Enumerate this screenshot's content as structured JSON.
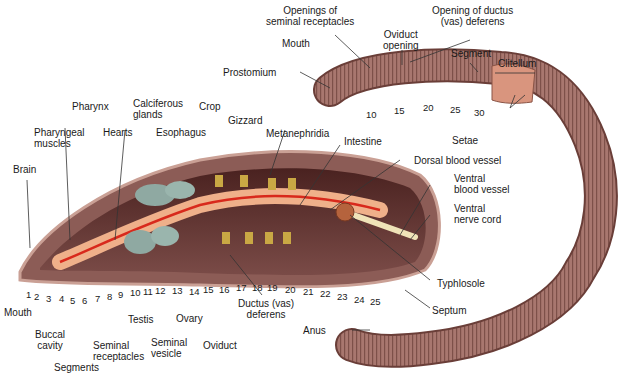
{
  "diagram": {
    "external_labels": {
      "openings_seminal": [
        "Openings of",
        "seminal receptacles"
      ],
      "opening_ductus": [
        "Opening of ductus",
        "(vas) deferens"
      ],
      "mouth_top": "Mouth",
      "oviduct_opening": [
        "Oviduct",
        "opening"
      ],
      "segment": "Segment",
      "clitellum": "Clitellum",
      "prostomium": "Prostomium",
      "setae": "Setae",
      "anus": "Anus",
      "ext_segment_numbers": [
        "10",
        "15",
        "20",
        "25",
        "30"
      ]
    },
    "internal_labels": {
      "pharynx": "Pharynx",
      "calciferous": [
        "Calciferous",
        "glands"
      ],
      "crop": "Crop",
      "pharyngeal": [
        "Pharyngeal",
        "muscles"
      ],
      "hearts": "Hearts",
      "esophagus": "Esophagus",
      "gizzard": "Gizzard",
      "metanephridia": "Metanephridia",
      "intestine": "Intestine",
      "dorsal_vessel": "Dorsal blood vessel",
      "ventral_vessel": [
        "Ventral",
        "blood vessel"
      ],
      "ventral_nerve": [
        "Ventral",
        "nerve cord"
      ],
      "brain": "Brain",
      "typhlosole": "Typhlosole",
      "septum": "Septum",
      "mouth_bottom": "Mouth",
      "buccal": [
        "Buccal",
        "cavity"
      ],
      "segments": "Segments",
      "seminal_receptacles": [
        "Seminal",
        "receptacles"
      ],
      "testis": "Testis",
      "seminal_vesicle": [
        "Seminal",
        "vesicle"
      ],
      "ovary": "Ovary",
      "oviduct": "Oviduct",
      "ductus": [
        "Ductus (vas)",
        "deferens"
      ],
      "segment_numbers": [
        "1",
        "2",
        "3",
        "4",
        "5",
        "6",
        "7",
        "8",
        "9",
        "10",
        "11",
        "12",
        "13",
        "14",
        "15",
        "16",
        "17",
        "18",
        "19",
        "20",
        "21",
        "22",
        "23",
        "24",
        "25"
      ]
    }
  },
  "colors": {
    "body_skin": "#a8776f",
    "body_dark": "#5a2e2a",
    "clitellum": "#d9957e",
    "blood_vessel": "#d8291c",
    "gut": "#efb08a",
    "seminal_vesicle": "#8fa9a2",
    "nephridia": "#c9a844"
  }
}
